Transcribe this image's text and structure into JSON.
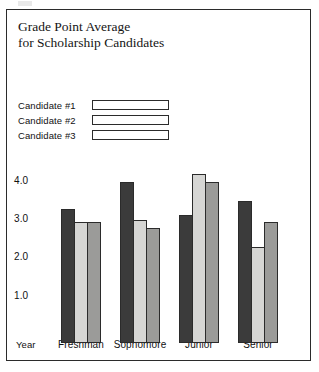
{
  "figure": {
    "background_color": "#ffffff",
    "frame_color": "#2b2b2b"
  },
  "chart_data": {
    "type": "bar",
    "title": "Grade Point Average\nfor Scholarship Candidates",
    "xlabel": "Year",
    "ylabel": "",
    "categories": [
      "Freshman",
      "Sophomore",
      "Junior",
      "Senior"
    ],
    "series": [
      {
        "name": "Candidate #1",
        "color": "#3b3b3b",
        "values": [
          3.5,
          4.2,
          3.35,
          3.7
        ]
      },
      {
        "name": "Candidate #2",
        "color": "#d6d6d4",
        "values": [
          3.15,
          3.2,
          4.4,
          2.5
        ]
      },
      {
        "name": "Candidate #3",
        "color": "#9b9b99",
        "values": [
          3.15,
          3.0,
          4.2,
          3.15
        ]
      }
    ],
    "ytick_labels": [
      "4.0",
      "3.0",
      "2.0",
      "1.0"
    ],
    "ytick_values": [
      4.0,
      3.0,
      2.0,
      1.0
    ],
    "ylim": [
      0,
      4.8
    ],
    "grid": false,
    "legend_position": "upper-left"
  }
}
